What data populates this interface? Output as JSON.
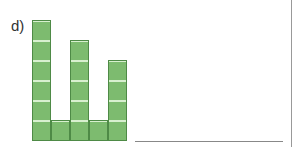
{
  "figure": {
    "label": "d)",
    "block_color": "#7dbb6f",
    "columns": [
      {
        "index": 1,
        "blocks": 6
      },
      {
        "index": 2,
        "blocks": 1
      },
      {
        "index": 3,
        "blocks": 5
      },
      {
        "index": 4,
        "blocks": 1
      },
      {
        "index": 5,
        "blocks": 4
      }
    ]
  },
  "answer_line": true
}
